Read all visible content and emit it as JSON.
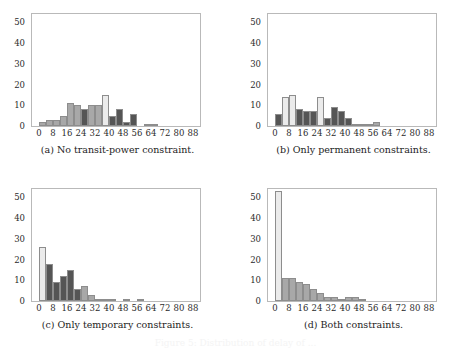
{
  "figure": {
    "layout": "2x2-subfigure-grid",
    "bottom_caption": "Figure 5: Distribution of delay of ...",
    "colors": {
      "light": "#ebebeb",
      "medium": "#a8a8a8",
      "dark": "#555555",
      "axis": "#b9b9b9",
      "text": "#2b2b2b"
    }
  },
  "chart_data": [
    {
      "type": "bar",
      "id": "a",
      "title": "(a) No transit-power constraint.",
      "xlabel": "",
      "ylabel": "",
      "xlim": [
        -4,
        92
      ],
      "ylim": [
        0,
        54
      ],
      "xticks": [
        "0",
        "8",
        "16",
        "24",
        "32",
        "40",
        "48",
        "56",
        "64",
        "72",
        "80",
        "88"
      ],
      "xtick_values": [
        0,
        8,
        16,
        24,
        32,
        40,
        48,
        56,
        64,
        72,
        80,
        88
      ],
      "yticks": [
        "0",
        "10",
        "20",
        "30",
        "40",
        "50"
      ],
      "ytick_values": [
        0,
        10,
        20,
        30,
        40,
        50
      ],
      "grid": false,
      "legend": "none",
      "bin_width": 4,
      "bins": [
        {
          "x": 0,
          "value": 2,
          "shade": "medium"
        },
        {
          "x": 4,
          "value": 3,
          "shade": "medium"
        },
        {
          "x": 8,
          "value": 3,
          "shade": "medium"
        },
        {
          "x": 12,
          "value": 5,
          "shade": "medium"
        },
        {
          "x": 16,
          "value": 11,
          "shade": "medium"
        },
        {
          "x": 20,
          "value": 10,
          "shade": "medium"
        },
        {
          "x": 24,
          "value": 8,
          "shade": "dark"
        },
        {
          "x": 28,
          "value": 10,
          "shade": "medium"
        },
        {
          "x": 32,
          "value": 10,
          "shade": "medium"
        },
        {
          "x": 36,
          "value": 15,
          "shade": "light"
        },
        {
          "x": 40,
          "value": 5,
          "shade": "dark"
        },
        {
          "x": 44,
          "value": 8,
          "shade": "dark"
        },
        {
          "x": 48,
          "value": 2,
          "shade": "dark"
        },
        {
          "x": 52,
          "value": 6,
          "shade": "dark"
        },
        {
          "x": 56,
          "value": 0,
          "shade": "dark"
        },
        {
          "x": 60,
          "value": 1,
          "shade": "medium"
        },
        {
          "x": 64,
          "value": 1,
          "shade": "medium"
        }
      ]
    },
    {
      "type": "bar",
      "id": "b",
      "title": "(b) Only permanent constraints.",
      "xlabel": "",
      "ylabel": "",
      "xlim": [
        -4,
        92
      ],
      "ylim": [
        0,
        54
      ],
      "xticks": [
        "0",
        "8",
        "16",
        "24",
        "32",
        "40",
        "48",
        "56",
        "64",
        "72",
        "80",
        "88"
      ],
      "xtick_values": [
        0,
        8,
        16,
        24,
        32,
        40,
        48,
        56,
        64,
        72,
        80,
        88
      ],
      "yticks": [
        "0",
        "10",
        "20",
        "30",
        "40",
        "50"
      ],
      "ytick_values": [
        0,
        10,
        20,
        30,
        40,
        50
      ],
      "grid": false,
      "legend": "none",
      "bin_width": 4,
      "bins": [
        {
          "x": 0,
          "value": 6,
          "shade": "dark"
        },
        {
          "x": 4,
          "value": 14,
          "shade": "light"
        },
        {
          "x": 8,
          "value": 15,
          "shade": "light"
        },
        {
          "x": 12,
          "value": 8,
          "shade": "dark"
        },
        {
          "x": 16,
          "value": 7,
          "shade": "dark"
        },
        {
          "x": 20,
          "value": 7,
          "shade": "dark"
        },
        {
          "x": 24,
          "value": 14,
          "shade": "light"
        },
        {
          "x": 28,
          "value": 4,
          "shade": "dark"
        },
        {
          "x": 32,
          "value": 9,
          "shade": "dark"
        },
        {
          "x": 36,
          "value": 7,
          "shade": "dark"
        },
        {
          "x": 40,
          "value": 4,
          "shade": "dark"
        },
        {
          "x": 44,
          "value": 1,
          "shade": "dark"
        },
        {
          "x": 48,
          "value": 1,
          "shade": "medium"
        },
        {
          "x": 52,
          "value": 1,
          "shade": "medium"
        },
        {
          "x": 56,
          "value": 2,
          "shade": "medium"
        }
      ]
    },
    {
      "type": "bar",
      "id": "c",
      "title": "(c) Only temporary constraints.",
      "xlabel": "",
      "ylabel": "",
      "xlim": [
        -4,
        92
      ],
      "ylim": [
        0,
        54
      ],
      "xticks": [
        "0",
        "8",
        "16",
        "24",
        "32",
        "40",
        "48",
        "56",
        "64",
        "72",
        "80",
        "88"
      ],
      "xtick_values": [
        0,
        8,
        16,
        24,
        32,
        40,
        48,
        56,
        64,
        72,
        80,
        88
      ],
      "yticks": [
        "0",
        "10",
        "20",
        "30",
        "40",
        "50"
      ],
      "ytick_values": [
        0,
        10,
        20,
        30,
        40,
        50
      ],
      "grid": false,
      "legend": "none",
      "bin_width": 4,
      "bins": [
        {
          "x": 0,
          "value": 26,
          "shade": "light"
        },
        {
          "x": 4,
          "value": 18,
          "shade": "dark"
        },
        {
          "x": 8,
          "value": 9,
          "shade": "dark"
        },
        {
          "x": 12,
          "value": 12,
          "shade": "dark"
        },
        {
          "x": 16,
          "value": 15,
          "shade": "dark"
        },
        {
          "x": 20,
          "value": 6,
          "shade": "dark"
        },
        {
          "x": 24,
          "value": 7,
          "shade": "medium"
        },
        {
          "x": 28,
          "value": 3,
          "shade": "medium"
        },
        {
          "x": 32,
          "value": 1,
          "shade": "medium"
        },
        {
          "x": 36,
          "value": 1,
          "shade": "medium"
        },
        {
          "x": 40,
          "value": 1,
          "shade": "medium"
        },
        {
          "x": 48,
          "value": 1,
          "shade": "medium"
        },
        {
          "x": 56,
          "value": 1,
          "shade": "medium"
        }
      ]
    },
    {
      "type": "bar",
      "id": "d",
      "title": "(d) Both constraints.",
      "xlabel": "",
      "ylabel": "",
      "xlim": [
        -4,
        92
      ],
      "ylim": [
        0,
        54
      ],
      "xticks": [
        "0",
        "8",
        "16",
        "24",
        "32",
        "40",
        "48",
        "56",
        "64",
        "72",
        "80",
        "88"
      ],
      "xtick_values": [
        0,
        8,
        16,
        24,
        32,
        40,
        48,
        56,
        64,
        72,
        80,
        88
      ],
      "yticks": [
        "0",
        "10",
        "20",
        "30",
        "40",
        "50"
      ],
      "ytick_values": [
        0,
        10,
        20,
        30,
        40,
        50
      ],
      "grid": false,
      "legend": "none",
      "bin_width": 4,
      "bins": [
        {
          "x": 0,
          "value": 53,
          "shade": "light"
        },
        {
          "x": 4,
          "value": 11,
          "shade": "medium"
        },
        {
          "x": 8,
          "value": 11,
          "shade": "medium"
        },
        {
          "x": 12,
          "value": 9,
          "shade": "medium"
        },
        {
          "x": 16,
          "value": 8,
          "shade": "medium"
        },
        {
          "x": 20,
          "value": 6,
          "shade": "medium"
        },
        {
          "x": 24,
          "value": 4,
          "shade": "medium"
        },
        {
          "x": 28,
          "value": 2,
          "shade": "medium"
        },
        {
          "x": 32,
          "value": 2,
          "shade": "medium"
        },
        {
          "x": 36,
          "value": 1,
          "shade": "medium"
        },
        {
          "x": 40,
          "value": 2,
          "shade": "medium"
        },
        {
          "x": 44,
          "value": 2,
          "shade": "medium"
        },
        {
          "x": 48,
          "value": 1,
          "shade": "medium"
        }
      ]
    }
  ]
}
